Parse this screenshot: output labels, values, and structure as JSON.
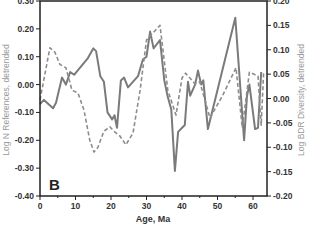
{
  "chart_data": {
    "type": "line",
    "title": "",
    "panel_label": "B",
    "xlabel": "Age, Ma",
    "ylabel": "Log N References, detrended",
    "ylabel_right": "Log BDR Diversity, detrended",
    "xlim": [
      0,
      64
    ],
    "ylim": [
      -0.4,
      0.3
    ],
    "ylim_right": [
      -0.2,
      0.2
    ],
    "x_ticks": [
      0,
      10,
      20,
      30,
      40,
      50,
      60
    ],
    "y_ticks": [
      "0.30",
      "0.20",
      "0.10",
      "0.00",
      "-0.10",
      "-0.20",
      "-0.30",
      "-0.40"
    ],
    "y_ticks_right": [
      "0.20",
      "0.15",
      "0.10",
      "0.05",
      "0.00",
      "-0.05",
      "-0.10",
      "-0.15",
      "-0.20"
    ],
    "grid": false,
    "legend": "none",
    "series": [
      {
        "name": "Log N References, detrended",
        "axis": "left",
        "style": "solid",
        "color": "#7a7a7a",
        "x": [
          0,
          1.1,
          3.7,
          4.5,
          6.2,
          7.3,
          8.5,
          9.6,
          13.5,
          15.0,
          15.8,
          17.0,
          18.0,
          19.0,
          20.3,
          21.0,
          21.7,
          22.8,
          23.7,
          24.8,
          27.6,
          29.0,
          30.0,
          31.0,
          32.0,
          33.8,
          35.0,
          36.0,
          37.0,
          38.0,
          38.9,
          40.8,
          41.7,
          42.3,
          43.7,
          44.5,
          45.4,
          46.0,
          47.3,
          55.0,
          57.5,
          58.3,
          59.0,
          60.6,
          61.4,
          62.3
        ],
        "values": [
          -0.07,
          -0.055,
          -0.085,
          -0.065,
          0.025,
          0.0,
          0.045,
          0.035,
          0.095,
          0.13,
          0.12,
          0.03,
          0.01,
          -0.1,
          -0.125,
          -0.11,
          -0.155,
          0.015,
          0.025,
          -0.01,
          0.03,
          0.09,
          0.1,
          0.19,
          0.13,
          0.16,
          0.015,
          -0.045,
          -0.09,
          -0.31,
          -0.17,
          -0.145,
          0.01,
          -0.04,
          0.0,
          0.05,
          0.0,
          0.015,
          -0.16,
          0.24,
          -0.2,
          -0.04,
          0.0,
          -0.16,
          -0.155,
          0.045
        ]
      },
      {
        "name": "Log BDR Diversity, detrended",
        "axis": "right",
        "style": "dashed",
        "color": "#8c8c8c",
        "x": [
          0,
          2.8,
          4.2,
          5.6,
          7.3,
          9.0,
          10.7,
          12.4,
          14.0,
          15.2,
          16.3,
          18.0,
          19.7,
          20.8,
          22.5,
          24.2,
          26.2,
          28.2,
          30.0,
          33.8,
          36.0,
          38.3,
          40.0,
          41.0,
          43.7,
          45.0,
          47.9,
          51.5,
          55.2,
          57.0,
          59.0,
          61.4,
          62.3,
          63.0
        ],
        "values": [
          -0.003,
          0.104,
          0.095,
          0.07,
          0.063,
          0.017,
          0.011,
          -0.024,
          -0.085,
          -0.11,
          -0.1,
          -0.067,
          -0.058,
          -0.067,
          -0.077,
          -0.095,
          -0.071,
          0.017,
          0.12,
          0.15,
          0.017,
          -0.034,
          0.042,
          0.052,
          0.03,
          0.034,
          -0.04,
          0.007,
          0.063,
          -0.06,
          0.054,
          0.046,
          -0.055,
          0.052
        ]
      }
    ]
  },
  "colors": {
    "axis": "#222222",
    "solid_line": "#7a7a7a",
    "dashed_line": "#8c8c8c",
    "axis_title": "#9a9a9a"
  }
}
